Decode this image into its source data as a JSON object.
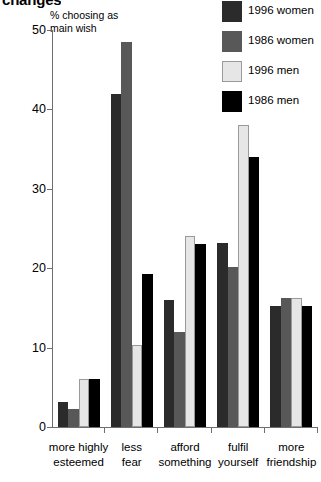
{
  "title": "changes",
  "axis_label": "% choosing as\nmain wish",
  "legend": {
    "position": "top-right",
    "items": [
      {
        "label": "1996 women",
        "color": "#2b2b2b"
      },
      {
        "label": "1986 women",
        "color": "#585858"
      },
      {
        "label": "1996 men",
        "color": "#e6e6e6"
      },
      {
        "label": "1986 men",
        "color": "#000000"
      }
    ]
  },
  "yticks": [
    "0",
    "10",
    "20",
    "30",
    "40",
    "50"
  ],
  "categories_display": [
    "more highly\nesteemed",
    "less\nfear",
    "afford\nsomething",
    "fulfil\nyourself",
    "more\nfriendship"
  ],
  "chart_data": {
    "type": "bar",
    "title": "changes",
    "xlabel": "",
    "ylabel": "% choosing as main wish",
    "ylim": [
      0,
      50
    ],
    "yticks": [
      0,
      10,
      20,
      30,
      40,
      50
    ],
    "grid": false,
    "legend_position": "top-right",
    "categories": [
      "more highly esteemed",
      "less fear",
      "afford something",
      "fulfil yourself",
      "more friendship"
    ],
    "series": [
      {
        "name": "1996 women",
        "color": "#2b2b2b",
        "values": [
          3.2,
          42.0,
          16.0,
          23.2,
          15.2
        ]
      },
      {
        "name": "1986 women",
        "color": "#585858",
        "values": [
          2.3,
          48.5,
          12.0,
          20.2,
          16.2
        ]
      },
      {
        "name": "1996 men",
        "color": "#e6e6e6",
        "values": [
          6.1,
          10.3,
          24.0,
          38.0,
          16.2
        ]
      },
      {
        "name": "1986 men",
        "color": "#000000",
        "values": [
          6.1,
          19.3,
          23.0,
          34.0,
          15.2
        ]
      }
    ]
  }
}
